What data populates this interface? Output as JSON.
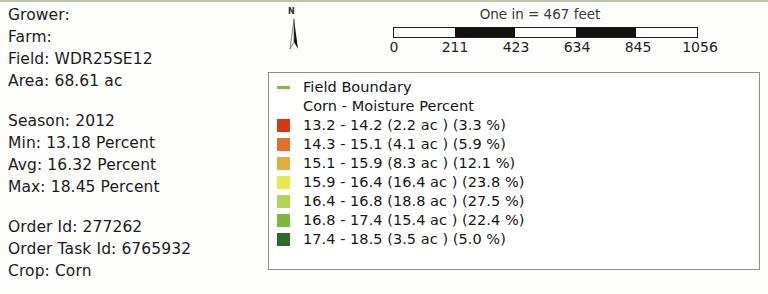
{
  "info_panel": {
    "lines": [
      "Grower:",
      "Farm:",
      "Field: WDR25SE12",
      "Area: 68.61 ac",
      "",
      "Season: 2012",
      "Min: 13.18 Percent",
      "Avg: 16.32 Percent",
      "Max: 18.45 Percent",
      "",
      "Order Id: 277262",
      "Order Task Id: 6765932",
      "Crop: Corn"
    ]
  },
  "north_arrow": {
    "label": "N",
    "icon": "north-arrow-icon"
  },
  "scale_bar": {
    "caption": "One in = 467 feet",
    "ticks": [
      "0",
      "211",
      "423",
      "634",
      "845",
      "1056"
    ],
    "segments": [
      "light",
      "dark",
      "light",
      "dark",
      "light"
    ],
    "units": "feet"
  },
  "legend": {
    "boundary": {
      "label": "Field Boundary",
      "color": "#7dbe4c"
    },
    "title": "Corn - Moisture Percent",
    "classes": [
      {
        "label": "13.2 - 14.2 (2.2 ac ) (3.3 %)",
        "color": "#d33a12",
        "range_min": 13.2,
        "range_max": 14.2,
        "acres": 2.2,
        "percent": 3.3
      },
      {
        "label": "14.3 - 15.1 (4.1 ac ) (5.9 %)",
        "color": "#e2702a",
        "range_min": 14.3,
        "range_max": 15.1,
        "acres": 4.1,
        "percent": 5.9
      },
      {
        "label": "15.1 - 15.9 (8.3 ac ) (12.1 %)",
        "color": "#e0ae3c",
        "range_min": 15.1,
        "range_max": 15.9,
        "acres": 8.3,
        "percent": 12.1
      },
      {
        "label": "15.9 - 16.4 (16.4 ac ) (23.8 %)",
        "color": "#e8e84c",
        "range_min": 15.9,
        "range_max": 16.4,
        "acres": 16.4,
        "percent": 23.8
      },
      {
        "label": "16.4 - 16.8 (18.8 ac ) (27.5 %)",
        "color": "#aed355",
        "range_min": 16.4,
        "range_max": 16.8,
        "acres": 18.8,
        "percent": 27.5
      },
      {
        "label": "16.8 - 17.4 (15.4 ac ) (22.4 %)",
        "color": "#79b83c",
        "range_min": 16.8,
        "range_max": 17.4,
        "acres": 15.4,
        "percent": 22.4
      },
      {
        "label": "17.4 - 18.5 (3.5 ac ) (5.0 %)",
        "color": "#2e6b2a",
        "range_min": 17.4,
        "range_max": 18.5,
        "acres": 3.5,
        "percent": 5.0
      }
    ]
  }
}
